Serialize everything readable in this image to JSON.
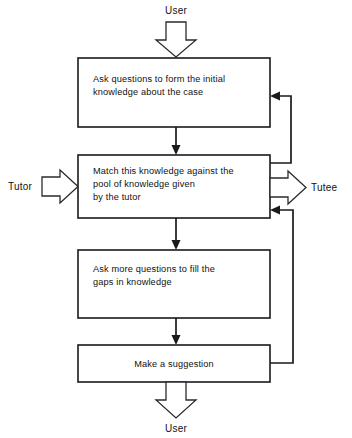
{
  "diagram": {
    "line_color": "#1a1a1a",
    "background_color": "#ffffff",
    "boxes": [
      {
        "id": "box-initial-questions",
        "lines": [
          "Ask questions to form the initial",
          "knowledge about the case"
        ],
        "align": "left"
      },
      {
        "id": "box-match-knowledge",
        "lines": [
          "Match this knowledge against the",
          "pool of knowledge given",
          "by the tutor"
        ],
        "align": "left"
      },
      {
        "id": "box-fill-gaps",
        "lines": [
          "Ask more questions to fill the",
          "gaps in knowledge"
        ],
        "align": "left"
      },
      {
        "id": "box-make-suggestion",
        "lines": [
          "Make a suggestion"
        ],
        "align": "center"
      }
    ],
    "external_labels": {
      "top_user": "User",
      "bottom_user": "User",
      "left_actor": "Tutor",
      "right_actor": "Tutee"
    }
  }
}
